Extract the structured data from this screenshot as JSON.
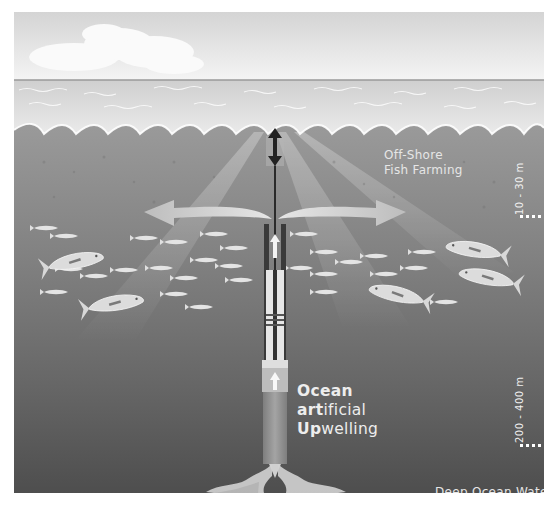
{
  "diagram": {
    "title": {
      "line1_bold": "Ocean",
      "line2_bold": "art",
      "line2_rest": "ificial",
      "line3_bold": "Up",
      "line3_rest": "welling"
    },
    "labels": {
      "surface_zone": [
        "Off-Shore",
        "Fish Farming"
      ],
      "surface_depth": "10 - 30 m",
      "deep_depth": "200 - 400 m",
      "deep_zone": "Deep Ocean Water"
    },
    "credit": "@Crean / GEOMAR",
    "elements": {
      "sky": "cloudy sky",
      "sea_surface": "waves",
      "pipe": "upwelling pipe with pump",
      "buoy_arrow": "vertical double arrow at surface",
      "outflow_arrows": [
        "left",
        "right"
      ],
      "intake": "deep water intake flow",
      "fish": "school of tuna and small fish"
    },
    "colors": {
      "sky": "#e8e8e8",
      "water_upper": "#8a8a8a",
      "water_deep": "#555555",
      "arrow_fill": "#c8c8c8",
      "pipe_light": "#e0e0e0",
      "pipe_dark": "#8c8c8c",
      "text": "#f0f0f0"
    }
  }
}
